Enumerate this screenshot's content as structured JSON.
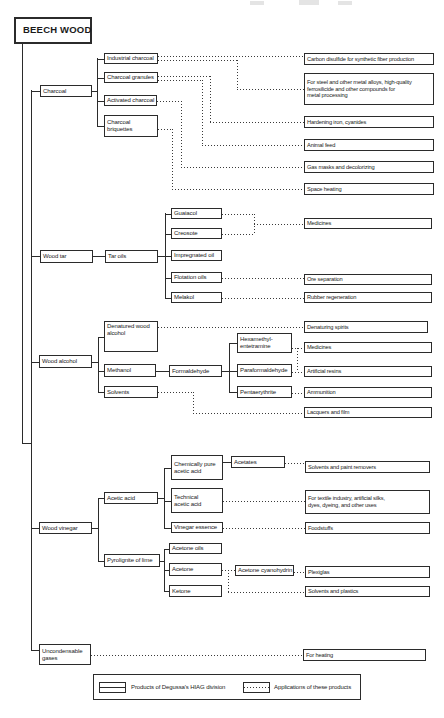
{
  "root": {
    "label": "BEECH WOOD"
  },
  "legend": {
    "products_label": "Products of Degussa's HIAG division",
    "applications_label": "Applications of these products"
  },
  "colors": {
    "line": "#2b2b2b",
    "background": "#ffffff",
    "text": "#1a1a1a"
  },
  "boxes": [
    {
      "id": "beech-wood",
      "label": "BEECH WOOD",
      "x": 14,
      "y": 17,
      "w": 78,
      "h": 27,
      "kind": "root"
    },
    {
      "id": "charcoal",
      "label": "Charcoal",
      "x": 40,
      "y": 85,
      "w": 52,
      "h": 12,
      "kind": "product"
    },
    {
      "id": "industrial-charcoal",
      "label": "Industrial charcoal",
      "x": 104,
      "y": 53,
      "w": 54,
      "h": 11,
      "kind": "product"
    },
    {
      "id": "charcoal-granules",
      "label": "Charcoal granules",
      "x": 104,
      "y": 72,
      "w": 54,
      "h": 11,
      "kind": "product"
    },
    {
      "id": "activated-charcoal",
      "label": "Activated charcoal",
      "x": 104,
      "y": 95,
      "w": 53,
      "h": 11,
      "kind": "product"
    },
    {
      "id": "charcoal-briquettes",
      "label": "Charcoal\nbriquettes",
      "x": 104,
      "y": 115,
      "w": 54,
      "h": 22,
      "kind": "product",
      "multi": true
    },
    {
      "id": "carbon-disulfide",
      "label": "Carbon disulfide for synthetic fiber production",
      "x": 304,
      "y": 53,
      "w": 130,
      "h": 12,
      "kind": "app"
    },
    {
      "id": "for-steel",
      "label": "For steel and other metal alloys, high-quality\nferrosilicide and other compounds for\nmetal processing",
      "x": 304,
      "y": 73,
      "w": 130,
      "h": 32,
      "kind": "app",
      "multi": true
    },
    {
      "id": "hardening-iron",
      "label": "Hardening iron, cyanides",
      "x": 304,
      "y": 116,
      "w": 130,
      "h": 12,
      "kind": "app"
    },
    {
      "id": "animal-feed",
      "label": "Animal feed",
      "x": 304,
      "y": 139,
      "w": 130,
      "h": 12,
      "kind": "app"
    },
    {
      "id": "gas-masks",
      "label": "Gas masks and decolorizing",
      "x": 304,
      "y": 161,
      "w": 130,
      "h": 12,
      "kind": "app"
    },
    {
      "id": "space-heating",
      "label": "Space heating",
      "x": 304,
      "y": 183,
      "w": 130,
      "h": 12,
      "kind": "app"
    },
    {
      "id": "wood-tar",
      "label": "Wood tar",
      "x": 40,
      "y": 250,
      "w": 53,
      "h": 13,
      "kind": "product"
    },
    {
      "id": "tar-oils",
      "label": "Tar oils",
      "x": 105,
      "y": 250,
      "w": 53,
      "h": 13,
      "kind": "product"
    },
    {
      "id": "guaiacol",
      "label": "Guaiacol",
      "x": 171,
      "y": 208,
      "w": 51,
      "h": 11,
      "kind": "product"
    },
    {
      "id": "creosote",
      "label": "Creosote",
      "x": 171,
      "y": 228,
      "w": 51,
      "h": 11,
      "kind": "product"
    },
    {
      "id": "impregnated-oil",
      "label": "Impregnated oil",
      "x": 171,
      "y": 250,
      "w": 51,
      "h": 11,
      "kind": "product"
    },
    {
      "id": "flotation-oils",
      "label": "Flotation oils",
      "x": 171,
      "y": 272,
      "w": 51,
      "h": 11,
      "kind": "product"
    },
    {
      "id": "melakol",
      "label": "Melakol",
      "x": 171,
      "y": 292,
      "w": 51,
      "h": 11,
      "kind": "product"
    },
    {
      "id": "medicines-tar",
      "label": "Medicines",
      "x": 304,
      "y": 218,
      "w": 128,
      "h": 11,
      "kind": "app"
    },
    {
      "id": "ore-separation",
      "label": "Ore separation",
      "x": 304,
      "y": 274,
      "w": 128,
      "h": 11,
      "kind": "app"
    },
    {
      "id": "rubber-regeneration",
      "label": "Rubber regeneration",
      "x": 304,
      "y": 292,
      "w": 128,
      "h": 11,
      "kind": "app"
    },
    {
      "id": "wood-alcohol",
      "label": "Wood alcohol",
      "x": 39,
      "y": 355,
      "w": 53,
      "h": 13,
      "kind": "product"
    },
    {
      "id": "denatured-wood-alcohol",
      "label": "Denatured wood\nalcohol",
      "x": 104,
      "y": 321,
      "w": 54,
      "h": 31,
      "kind": "product",
      "multi": true,
      "top": true
    },
    {
      "id": "methanol",
      "label": "Methanol",
      "x": 104,
      "y": 364,
      "w": 52,
      "h": 13,
      "kind": "product"
    },
    {
      "id": "solvents",
      "label": "Solvents",
      "x": 104,
      "y": 386,
      "w": 54,
      "h": 12,
      "kind": "product"
    },
    {
      "id": "formaldehyde",
      "label": "Formaldehyde",
      "x": 169,
      "y": 365,
      "w": 53,
      "h": 12,
      "kind": "product"
    },
    {
      "id": "hexamethylentetramine",
      "label": "Hexamethyl-\nentetramine",
      "x": 237,
      "y": 333,
      "w": 55,
      "h": 20,
      "kind": "product",
      "multi": true
    },
    {
      "id": "paraformaldehyde",
      "label": "Paraformaldehyde",
      "x": 237,
      "y": 364,
      "w": 55,
      "h": 13,
      "kind": "product"
    },
    {
      "id": "pentaerythrite",
      "label": "Pentaerythrite",
      "x": 237,
      "y": 386,
      "w": 55,
      "h": 12,
      "kind": "product"
    },
    {
      "id": "denaturing-spirits",
      "label": "Denaturing spirits",
      "x": 304,
      "y": 321,
      "w": 124,
      "h": 12,
      "kind": "app"
    },
    {
      "id": "medicines-alcohol",
      "label": "Medicines",
      "x": 304,
      "y": 342,
      "w": 128,
      "h": 11,
      "kind": "app"
    },
    {
      "id": "artificial-resins",
      "label": "Artificial resins",
      "x": 304,
      "y": 366,
      "w": 128,
      "h": 11,
      "kind": "app"
    },
    {
      "id": "ammunition",
      "label": "Ammunition",
      "x": 304,
      "y": 387,
      "w": 128,
      "h": 11,
      "kind": "app"
    },
    {
      "id": "lacquers-film",
      "label": "Lacquers and film",
      "x": 304,
      "y": 407,
      "w": 128,
      "h": 11,
      "kind": "app"
    },
    {
      "id": "wood-vinegar",
      "label": "Wood vinegar",
      "x": 39,
      "y": 522,
      "w": 53,
      "h": 12,
      "kind": "product"
    },
    {
      "id": "acetic-acid",
      "label": "Acetic acid",
      "x": 104,
      "y": 492,
      "w": 54,
      "h": 12,
      "kind": "product"
    },
    {
      "id": "pyrolignite-of-lime",
      "label": "Pyrolignite of lime",
      "x": 104,
      "y": 554,
      "w": 56,
      "h": 13,
      "kind": "product"
    },
    {
      "id": "chemically-pure-acetic-acid",
      "label": "Chemically pure\nacetic acid",
      "x": 171,
      "y": 455,
      "w": 52,
      "h": 25,
      "kind": "product",
      "multi": true
    },
    {
      "id": "technical-acetic-acid",
      "label": "Technical\nacetic acid",
      "x": 171,
      "y": 488,
      "w": 52,
      "h": 25,
      "kind": "product",
      "multi": true
    },
    {
      "id": "vinegar-essence",
      "label": "Vinegar essence",
      "x": 171,
      "y": 522,
      "w": 52,
      "h": 11,
      "kind": "product"
    },
    {
      "id": "acetates",
      "label": "Acetates",
      "x": 231,
      "y": 456,
      "w": 54,
      "h": 12,
      "kind": "product"
    },
    {
      "id": "acetone-oils",
      "label": "Acetone oils",
      "x": 169,
      "y": 543,
      "w": 53,
      "h": 11,
      "kind": "product"
    },
    {
      "id": "acetone",
      "label": "Acetone",
      "x": 169,
      "y": 563,
      "w": 53,
      "h": 13,
      "kind": "product"
    },
    {
      "id": "ketone",
      "label": "Ketone",
      "x": 169,
      "y": 585,
      "w": 53,
      "h": 12,
      "kind": "product"
    },
    {
      "id": "acetone-cyanohydrin",
      "label": "Acetone cyanohydrin",
      "x": 235,
      "y": 565,
      "w": 59,
      "h": 11,
      "kind": "product"
    },
    {
      "id": "solvents-paint-removers",
      "label": "Solvents and paint removers",
      "x": 305,
      "y": 461,
      "w": 125,
      "h": 12,
      "kind": "app"
    },
    {
      "id": "for-textile",
      "label": "For textile industry, artificial silks,\ndyes, dyeing, and other uses",
      "x": 305,
      "y": 490,
      "w": 125,
      "h": 24,
      "kind": "app",
      "multi": true
    },
    {
      "id": "foodstuffs",
      "label": "Foodstuffs",
      "x": 305,
      "y": 522,
      "w": 125,
      "h": 12,
      "kind": "app"
    },
    {
      "id": "plexiglas",
      "label": "Plexiglas",
      "x": 305,
      "y": 566,
      "w": 125,
      "h": 12,
      "kind": "app"
    },
    {
      "id": "solvents-plastics",
      "label": "Solvents and plastics",
      "x": 305,
      "y": 586,
      "w": 125,
      "h": 11,
      "kind": "app"
    },
    {
      "id": "uncondensable-gases",
      "label": "Uncondensable\ngases",
      "x": 39,
      "y": 644,
      "w": 52,
      "h": 21,
      "kind": "product",
      "multi": true
    },
    {
      "id": "for-heating",
      "label": "For heating",
      "x": 303,
      "y": 649,
      "w": 123,
      "h": 12,
      "kind": "app"
    }
  ],
  "edges": [
    [
      "s",
      "v",
      21.5,
      44,
      399
    ],
    [
      "s",
      "h",
      21.5,
      443,
      10
    ],
    [
      "s",
      "v",
      30.5,
      90,
      560
    ],
    [
      "s",
      "h",
      31,
      91,
      9
    ],
    [
      "s",
      "h",
      31,
      256,
      9
    ],
    [
      "s",
      "h",
      31,
      362,
      8
    ],
    [
      "s",
      "h",
      31,
      528,
      8
    ],
    [
      "s",
      "h",
      31,
      650,
      8
    ],
    [
      "s",
      "h",
      92,
      91,
      5
    ],
    [
      "s",
      "v",
      97,
      58,
      68
    ],
    [
      "s",
      "h",
      97,
      58.5,
      7
    ],
    [
      "s",
      "h",
      97,
      77.5,
      7
    ],
    [
      "s",
      "h",
      97,
      100.5,
      7
    ],
    [
      "s",
      "h",
      97,
      126,
      7
    ],
    [
      "s",
      "h",
      93,
      256,
      12
    ],
    [
      "s",
      "h",
      158,
      256,
      7
    ],
    [
      "s",
      "v",
      165,
      213,
      85
    ],
    [
      "s",
      "h",
      165,
      213.5,
      6
    ],
    [
      "s",
      "h",
      165,
      233.5,
      6
    ],
    [
      "s",
      "h",
      165,
      255.5,
      6
    ],
    [
      "s",
      "h",
      165,
      277.5,
      6
    ],
    [
      "s",
      "h",
      165,
      297.5,
      6
    ],
    [
      "s",
      "h",
      92,
      362,
      6
    ],
    [
      "s",
      "v",
      98,
      337,
      55
    ],
    [
      "s",
      "h",
      98,
      337,
      6
    ],
    [
      "s",
      "h",
      98,
      370.5,
      6
    ],
    [
      "s",
      "h",
      98,
      392,
      6
    ],
    [
      "s",
      "h",
      156,
      370.5,
      13
    ],
    [
      "s",
      "h",
      222,
      370.5,
      7
    ],
    [
      "s",
      "v",
      229,
      343,
      49
    ],
    [
      "s",
      "h",
      229,
      343,
      8
    ],
    [
      "s",
      "h",
      229,
      370.5,
      8
    ],
    [
      "s",
      "h",
      229,
      392,
      8
    ],
    [
      "s",
      "h",
      92,
      528,
      6
    ],
    [
      "s",
      "v",
      98,
      498,
      62.5
    ],
    [
      "s",
      "h",
      98,
      498,
      6
    ],
    [
      "s",
      "h",
      98,
      560.5,
      6
    ],
    [
      "s",
      "h",
      158,
      498,
      6
    ],
    [
      "s",
      "v",
      164,
      467.5,
      60
    ],
    [
      "s",
      "h",
      164,
      467.5,
      7
    ],
    [
      "s",
      "h",
      164,
      500.5,
      7
    ],
    [
      "s",
      "h",
      164,
      527.5,
      7
    ],
    [
      "s",
      "h",
      223,
      462,
      8
    ],
    [
      "s",
      "h",
      160,
      560.5,
      4
    ],
    [
      "s",
      "v",
      164,
      548.5,
      42.5
    ],
    [
      "s",
      "h",
      164,
      548.5,
      5
    ],
    [
      "s",
      "h",
      164,
      569.5,
      5
    ],
    [
      "s",
      "h",
      164,
      591,
      5
    ],
    [
      "d",
      "h",
      158,
      56,
      146
    ],
    [
      "d",
      "h",
      158,
      60,
      79
    ],
    [
      "d",
      "v",
      237,
      60,
      29
    ],
    [
      "d",
      "h",
      237,
      89,
      67
    ],
    [
      "d",
      "h",
      158,
      76,
      52
    ],
    [
      "d",
      "v",
      210,
      76,
      46
    ],
    [
      "d",
      "h",
      210,
      122,
      94
    ],
    [
      "d",
      "h",
      158,
      80,
      44
    ],
    [
      "d",
      "v",
      202,
      80,
      65
    ],
    [
      "d",
      "h",
      202,
      145,
      102
    ],
    [
      "d",
      "h",
      157,
      101,
      24
    ],
    [
      "d",
      "v",
      181,
      101,
      66
    ],
    [
      "d",
      "h",
      181,
      167,
      123
    ],
    [
      "d",
      "h",
      158,
      129,
      14
    ],
    [
      "d",
      "v",
      172,
      129,
      60
    ],
    [
      "d",
      "h",
      172,
      189,
      132
    ],
    [
      "d",
      "h",
      222,
      213.5,
      32
    ],
    [
      "d",
      "h",
      222,
      233.5,
      32
    ],
    [
      "d",
      "v",
      254,
      213.5,
      20
    ],
    [
      "d",
      "h",
      254,
      223.5,
      50
    ],
    [
      "d",
      "h",
      222,
      278,
      82
    ],
    [
      "d",
      "h",
      222,
      297.5,
      82
    ],
    [
      "d",
      "h",
      158,
      327,
      146
    ],
    [
      "d",
      "h",
      292,
      347.5,
      12
    ],
    [
      "d",
      "v",
      297,
      347.5,
      24
    ],
    [
      "d",
      "h",
      292,
      371.5,
      12
    ],
    [
      "d",
      "h",
      292,
      392.5,
      12
    ],
    [
      "d",
      "h",
      158,
      392,
      35
    ],
    [
      "d",
      "v",
      193,
      392,
      20.5
    ],
    [
      "d",
      "h",
      193,
      412.5,
      111
    ],
    [
      "d",
      "h",
      285,
      463,
      20
    ],
    [
      "d",
      "h",
      223,
      501,
      82
    ],
    [
      "d",
      "h",
      223,
      528,
      82
    ],
    [
      "d",
      "h",
      222,
      570,
      13
    ],
    [
      "d",
      "v",
      228,
      570,
      21.5
    ],
    [
      "d",
      "h",
      228,
      591.5,
      77
    ],
    [
      "d",
      "h",
      294,
      571.5,
      11
    ],
    [
      "d",
      "h",
      91,
      655,
      212
    ]
  ]
}
